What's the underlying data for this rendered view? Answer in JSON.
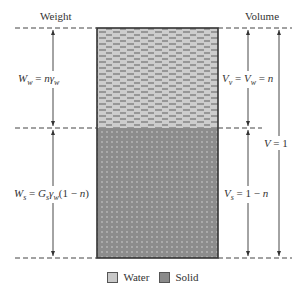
{
  "headers": {
    "weight": "Weight",
    "volume": "Volume"
  },
  "labels": {
    "water_weight": "W_w = nγ_w",
    "solid_weight": "W_s = G_s γ_w (1 − n)",
    "void_volume": "V_v = V_w = n",
    "solid_volume": "V_s = 1 − n",
    "total_volume": "V = 1"
  },
  "legend": [
    {
      "label": "Water",
      "pattern": "dashes",
      "color": "#c8c8c8"
    },
    {
      "label": "Solid",
      "pattern": "dots",
      "color": "#8a8a8a"
    }
  ],
  "colors": {
    "water_fill": "#cdcdcd",
    "solid_fill": "#8c8c8c",
    "lines": "#333333"
  }
}
